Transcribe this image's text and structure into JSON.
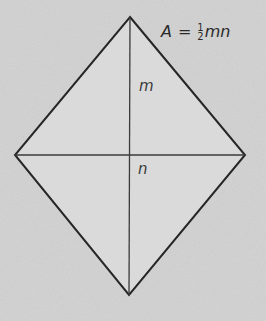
{
  "diagram": {
    "type": "rhombus-with-diagonals",
    "colors": {
      "background": "#d6d6d6",
      "fill": "#dcdcdc",
      "stroke": "#2a2a2a",
      "text": "#3a3a3a"
    },
    "vertices": {
      "top": [
        130,
        17
      ],
      "right": [
        245,
        155
      ],
      "bottom": [
        129,
        295
      ],
      "left": [
        15,
        155
      ]
    },
    "labels": {
      "vertical_diagonal": "m",
      "horizontal_diagonal": "n"
    },
    "formula": {
      "lhs": "A",
      "equals": "=",
      "numerator": "1",
      "denominator": "2",
      "variables": "mn"
    }
  }
}
